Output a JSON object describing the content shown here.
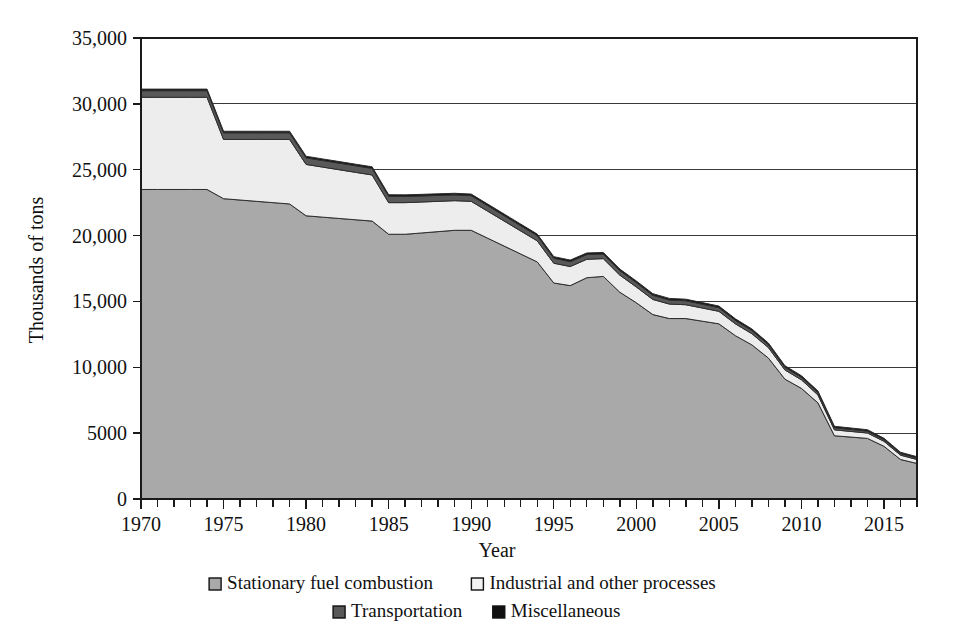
{
  "chart_data": {
    "type": "area",
    "stacked": true,
    "title": "",
    "xlabel": "Year",
    "ylabel": "Thousands of tons",
    "xlim": [
      1970,
      2017
    ],
    "ylim": [
      0,
      35000
    ],
    "grid": true,
    "legend_position": "bottom",
    "y_ticks": [
      0,
      5000,
      10000,
      15000,
      20000,
      25000,
      30000,
      35000
    ],
    "y_tick_labels": [
      "0",
      "5000",
      "10,000",
      "15,000",
      "20,000",
      "25,000",
      "30,000",
      "35,000"
    ],
    "x_ticks": [
      1970,
      1975,
      1980,
      1985,
      1990,
      1995,
      2000,
      2005,
      2010,
      2015
    ],
    "x_tick_labels": [
      "1970",
      "1975",
      "1980",
      "1985",
      "1990",
      "1995",
      "2000",
      "2005",
      "2010",
      "2015"
    ],
    "x_minor_tick_step": 1,
    "x": [
      1970,
      1971,
      1972,
      1973,
      1974,
      1975,
      1976,
      1977,
      1978,
      1979,
      1980,
      1981,
      1982,
      1983,
      1984,
      1985,
      1986,
      1987,
      1988,
      1989,
      1990,
      1991,
      1992,
      1993,
      1994,
      1995,
      1996,
      1997,
      1998,
      1999,
      2000,
      2001,
      2002,
      2003,
      2004,
      2005,
      2006,
      2007,
      2008,
      2009,
      2010,
      2011,
      2012,
      2013,
      2014,
      2015,
      2016,
      2017
    ],
    "series": [
      {
        "name": "Stationary fuel combustion",
        "color": "#A9A9A9",
        "values": [
          23500,
          23500,
          23500,
          23500,
          23500,
          22800,
          22700,
          22600,
          22500,
          22400,
          21500,
          21400,
          21300,
          21200,
          21100,
          20100,
          20100,
          20200,
          20300,
          20400,
          20400,
          19800,
          19200,
          18600,
          18000,
          16400,
          16200,
          16800,
          16900,
          15700,
          14900,
          14000,
          13700,
          13700,
          13500,
          13300,
          12400,
          11700,
          10700,
          9100,
          8400,
          7300,
          4800,
          4700,
          4600,
          4000,
          3000,
          2700
        ]
      },
      {
        "name": "Industrial and other processes",
        "color": "#EDEDED",
        "values": [
          7000,
          7000,
          7000,
          7000,
          7000,
          4500,
          4600,
          4700,
          4800,
          4900,
          3900,
          3800,
          3700,
          3600,
          3500,
          2400,
          2400,
          2350,
          2300,
          2250,
          2200,
          2050,
          1900,
          1750,
          1600,
          1500,
          1450,
          1400,
          1350,
          1300,
          1200,
          1150,
          1100,
          1050,
          1000,
          950,
          900,
          850,
          800,
          700,
          650,
          600,
          450,
          430,
          410,
          380,
          330,
          300
        ]
      },
      {
        "name": "Transportation",
        "color": "#595959",
        "values": [
          500,
          500,
          500,
          500,
          500,
          500,
          500,
          500,
          500,
          500,
          500,
          500,
          500,
          500,
          500,
          480,
          470,
          460,
          450,
          440,
          430,
          420,
          410,
          400,
          390,
          380,
          370,
          360,
          350,
          340,
          330,
          320,
          310,
          300,
          290,
          280,
          260,
          240,
          220,
          200,
          190,
          180,
          160,
          150,
          140,
          130,
          120,
          110
        ]
      },
      {
        "name": "Miscellaneous",
        "color": "#111111",
        "values": [
          120,
          120,
          120,
          120,
          120,
          120,
          120,
          120,
          120,
          120,
          120,
          120,
          120,
          120,
          120,
          120,
          120,
          120,
          120,
          120,
          120,
          120,
          120,
          120,
          120,
          120,
          120,
          120,
          120,
          120,
          120,
          120,
          120,
          120,
          120,
          120,
          120,
          120,
          120,
          120,
          120,
          120,
          110,
          110,
          110,
          100,
          100,
          100
        ]
      }
    ],
    "totals": [
      31120,
      31120,
      31120,
      31120,
      31120,
      27920,
      27920,
      27780,
      27920,
      27920,
      26020,
      25820,
      25620,
      25420,
      25220,
      23100,
      23090,
      23130,
      23170,
      23210,
      23150,
      22390,
      21630,
      20870,
      20110,
      18400,
      18140,
      18680,
      18720,
      17460,
      16550,
      15590,
      15230,
      15170,
      14910,
      14650,
      13680,
      12910,
      11840,
      10120,
      9360,
      8200,
      5520,
      5390,
      5260,
      4610,
      3550,
      3210
    ]
  },
  "legend": {
    "items": [
      {
        "label": "Stationary fuel combustion",
        "swatch": "#A9A9A9"
      },
      {
        "label": "Industrial and other processes",
        "swatch": "#F2F2F2"
      },
      {
        "label": "Transportation",
        "swatch": "#595959"
      },
      {
        "label": "Miscellaneous",
        "swatch": "#111111"
      }
    ]
  }
}
